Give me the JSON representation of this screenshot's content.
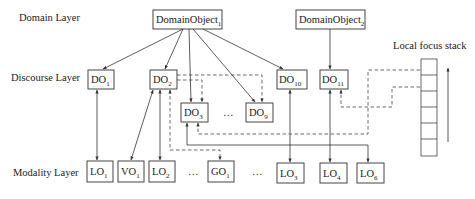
{
  "layers": {
    "domain": "Domain Layer",
    "discourse": "Discourse Layer",
    "modality": "Modality Layer"
  },
  "domain_objects": [
    {
      "id": "DomainObject1",
      "base": "DomainObject",
      "sub": "1"
    },
    {
      "id": "DomainObject2",
      "base": "DomainObject",
      "sub": "2"
    }
  ],
  "discourse_objects": [
    {
      "id": "DO1",
      "base": "DO",
      "sub": "1"
    },
    {
      "id": "DO2",
      "base": "DO",
      "sub": "2"
    },
    {
      "id": "DO3",
      "base": "DO",
      "sub": "3"
    },
    {
      "id": "DO9",
      "base": "DO",
      "sub": "9"
    },
    {
      "id": "DO10",
      "base": "DO",
      "sub": "10"
    },
    {
      "id": "DO11",
      "base": "DO",
      "sub": "11"
    }
  ],
  "modality_objects": [
    {
      "id": "LO1",
      "base": "LO",
      "sub": "1"
    },
    {
      "id": "VO1",
      "base": "VO",
      "sub": "1"
    },
    {
      "id": "LO2",
      "base": "LO",
      "sub": "2"
    },
    {
      "id": "GO1",
      "base": "GO",
      "sub": "1"
    },
    {
      "id": "LO3",
      "base": "LO",
      "sub": "3"
    },
    {
      "id": "LO4",
      "base": "LO",
      "sub": "4"
    },
    {
      "id": "LO6",
      "base": "LO",
      "sub": "6"
    }
  ],
  "ellipsis": "…",
  "focus_stack": {
    "label": "Local focus stack",
    "cells": 7
  }
}
